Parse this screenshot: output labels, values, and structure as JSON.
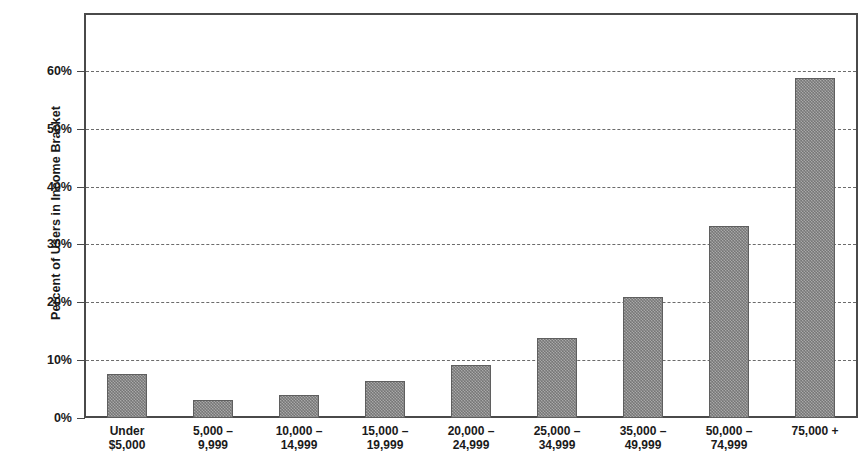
{
  "chart_data": {
    "type": "bar",
    "title": "",
    "xlabel": "",
    "ylabel": "Percent of Users in Income Bracket",
    "categories": [
      "Under\n$5,000",
      "5,000 –\n9,999",
      "10,000 –\n14,999",
      "15,000 –\n19,999",
      "20,000 –\n24,999",
      "25,000 –\n34,999",
      "35,000 –\n49,999",
      "50,000 –\n74,999",
      "75,000 +"
    ],
    "values": [
      7.6,
      3.1,
      4.0,
      6.4,
      9.2,
      13.8,
      20.9,
      33.2,
      58.7
    ],
    "ylim": [
      0,
      70
    ],
    "ytick_values": [
      0,
      10,
      20,
      30,
      40,
      50,
      60
    ],
    "ytick_labels": [
      "0%",
      "10%",
      "20%",
      "30%",
      "40%",
      "50%",
      "60%"
    ],
    "grid": "horizontal-dashed",
    "legend": "none",
    "bar_color": "#8f8f8f",
    "bar_edge_color": "#5f5f5f",
    "axis_color": "#4a4a4a",
    "grid_color": "#6b6b6b",
    "background": "#ffffff"
  }
}
